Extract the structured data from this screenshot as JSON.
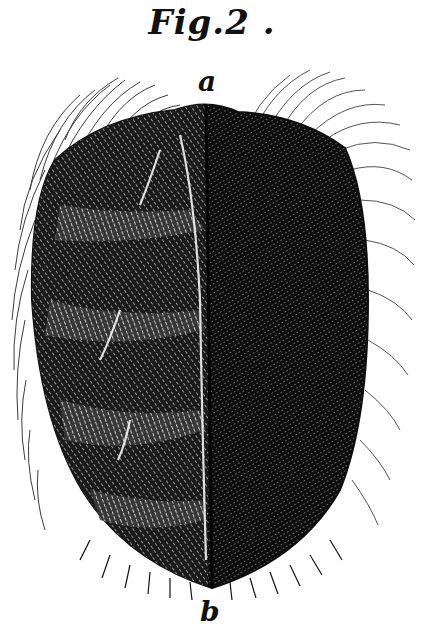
{
  "figure": {
    "title": "Fig.2 .",
    "labels": {
      "top": "a",
      "bottom": "b"
    },
    "colors": {
      "ink": "#111111",
      "paper": "#ffffff"
    }
  }
}
